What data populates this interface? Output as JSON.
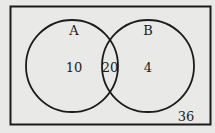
{
  "diagram": {
    "type": "venn",
    "universal_set": {
      "outside_value": "36"
    },
    "sets": [
      {
        "label": "A",
        "only_value": "10"
      },
      {
        "label": "B",
        "only_value": "4"
      }
    ],
    "intersection_value": "20"
  },
  "colors": {
    "background": "#e9e9e7",
    "stroke": "#1c1c1c"
  }
}
